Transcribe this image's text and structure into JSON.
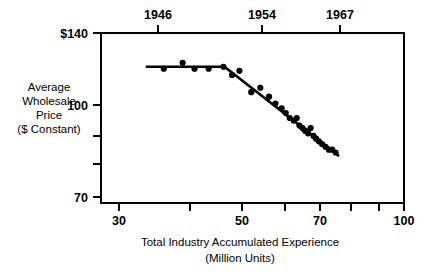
{
  "chart_data": {
    "type": "scatter",
    "title": "",
    "subtitle": "",
    "xlabel": "Total Industry Accumulated Experience",
    "xlabel_line2": "(Million Units)",
    "ylabel_lines": [
      "Average",
      "Wholesale",
      "Price",
      "($ Constant)"
    ],
    "xscale": "log",
    "yscale": "log",
    "xlim": [
      30,
      100
    ],
    "ylim": [
      70,
      140
    ],
    "grid": false,
    "legend": null,
    "x_ticks": [
      {
        "value": 30,
        "label": "30"
      },
      {
        "value": 40,
        "label": ""
      },
      {
        "value": 50,
        "label": "50"
      },
      {
        "value": 60,
        "label": ""
      },
      {
        "value": 70,
        "label": "70"
      },
      {
        "value": 80,
        "label": ""
      },
      {
        "value": 90,
        "label": ""
      },
      {
        "value": 100,
        "label": "100"
      }
    ],
    "y_ticks": [
      {
        "value": 140,
        "label": "$140"
      },
      {
        "value": 100,
        "label": "100"
      },
      {
        "value": 90,
        "label": ""
      },
      {
        "value": 80,
        "label": ""
      },
      {
        "value": 70,
        "label": "70"
      }
    ],
    "top_axis": {
      "name": "year",
      "ticks": [
        {
          "x_value": 38.5,
          "label": "1946"
        },
        {
          "x_value": 57.0,
          "label": "1954"
        },
        {
          "x_value": 76.0,
          "label": "1967"
        }
      ]
    },
    "xlabel_unit": "Million Units",
    "ylabel_unit": "$ Constant",
    "points": [
      {
        "x": 38.5,
        "y": 121
      },
      {
        "x": 41.5,
        "y": 124
      },
      {
        "x": 43.5,
        "y": 121
      },
      {
        "x": 46.0,
        "y": 121
      },
      {
        "x": 48.8,
        "y": 122
      },
      {
        "x": 50.5,
        "y": 118
      },
      {
        "x": 52.0,
        "y": 120
      },
      {
        "x": 54.5,
        "y": 110
      },
      {
        "x": 56.5,
        "y": 112
      },
      {
        "x": 58.5,
        "y": 108
      },
      {
        "x": 60.0,
        "y": 105
      },
      {
        "x": 61.5,
        "y": 103
      },
      {
        "x": 62.5,
        "y": 101
      },
      {
        "x": 63.5,
        "y": 99
      },
      {
        "x": 64.5,
        "y": 98
      },
      {
        "x": 65.3,
        "y": 99
      },
      {
        "x": 66.0,
        "y": 96
      },
      {
        "x": 66.8,
        "y": 95
      },
      {
        "x": 67.5,
        "y": 94
      },
      {
        "x": 68.3,
        "y": 93
      },
      {
        "x": 69.0,
        "y": 95
      },
      {
        "x": 69.8,
        "y": 92
      },
      {
        "x": 70.5,
        "y": 91
      },
      {
        "x": 71.3,
        "y": 90
      },
      {
        "x": 72.2,
        "y": 89
      },
      {
        "x": 73.2,
        "y": 88
      },
      {
        "x": 74.2,
        "y": 87
      },
      {
        "x": 75.2,
        "y": 87
      },
      {
        "x": 76.2,
        "y": 86
      }
    ],
    "trend_segments": [
      {
        "name": "flat-plateau",
        "x1": 36.0,
        "y1": 122,
        "x2": 49.0,
        "y2": 122
      },
      {
        "name": "decline",
        "x1": 49.0,
        "y1": 122,
        "x2": 77.0,
        "y2": 85
      }
    ]
  }
}
